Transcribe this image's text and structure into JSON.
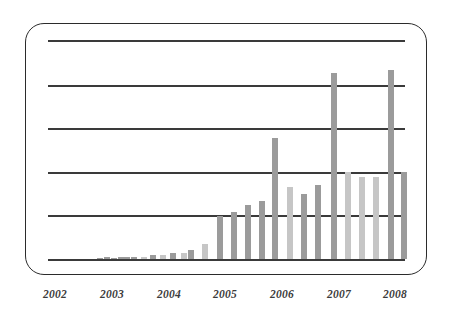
{
  "chart_data": {
    "type": "bar",
    "title": "",
    "subtitle": "",
    "xlabel": "",
    "ylabel": "",
    "grid": true,
    "legend": null,
    "annotations": [],
    "axis": {
      "x_tick_labels": [
        "2002",
        "2003",
        "2004",
        "2005",
        "2006",
        "2007",
        "2008"
      ],
      "x_tick_positions_px": [
        55,
        112,
        169,
        225,
        282,
        339,
        395
      ],
      "y_gridline_positions_px": [
        40,
        85,
        128,
        172,
        215,
        259
      ],
      "y_gridline_values": [
        5,
        4,
        3,
        2,
        1,
        0
      ],
      "ylim": [
        0,
        5
      ],
      "y_tick_labels": []
    },
    "bar_style": {
      "color_dark": "#9b9b9b",
      "color_light": "#c6c6c6",
      "width_px": 6,
      "baseline_px": 259
    },
    "series": [
      {
        "name": "quarterly value",
        "categories": [
          "2002 Q1",
          "2002 Q2",
          "2002 Q3",
          "2002 Q4",
          "2003 Q1",
          "2003 Q2",
          "2003 Q3",
          "2003 Q4",
          "2004 Q1",
          "2004 Q2",
          "2004 Q3",
          "2004 Q4",
          "2005 Q1",
          "2005 Q2",
          "2005 Q3",
          "2005 Q4",
          "2006 Q1",
          "2006 Q2",
          "2006 Q3",
          "2006 Q4",
          "2007 Q1",
          "2007 Q2",
          "2007 Q3",
          "2007 Q4",
          "2008 Q1",
          "2008 Q2"
        ],
        "values": [
          0.0,
          0.0,
          0.0,
          0.0,
          0.03,
          0.03,
          0.05,
          0.05,
          0.09,
          0.09,
          0.14,
          0.14,
          0.22,
          0.35,
          1.03,
          1.12,
          1.28,
          1.38,
          2.78,
          1.58,
          1.48,
          1.62,
          4.24,
          2.08,
          1.98,
          2.0
        ],
        "bar_x_positions_px": [
          62,
          76,
          90,
          104,
          105,
          118,
          131,
          140,
          151,
          160,
          172,
          182,
          188,
          202,
          218,
          232,
          245,
          260,
          273,
          288,
          302,
          316,
          331,
          345,
          359,
          373
        ]
      }
    ]
  },
  "bars": [
    {
      "x": 104,
      "h": 2,
      "tone": "dark",
      "label": "bar-1"
    },
    {
      "x": 118,
      "h": 2,
      "tone": "dark",
      "label": "bar-2"
    },
    {
      "x": 131,
      "h": 2.5,
      "tone": "dark",
      "label": "bar-3"
    },
    {
      "x": 141,
      "h": 2.5,
      "tone": "light",
      "label": "bar-4"
    },
    {
      "x": 150,
      "h": 4,
      "tone": "dark",
      "label": "bar-5"
    },
    {
      "x": 160,
      "h": 4,
      "tone": "light",
      "label": "bar-6"
    },
    {
      "x": 170,
      "h": 6,
      "tone": "dark",
      "label": "bar-7"
    },
    {
      "x": 181,
      "h": 6,
      "tone": "light",
      "label": "bar-8"
    },
    {
      "x": 188,
      "h": 9,
      "tone": "dark",
      "label": "bar-9"
    },
    {
      "x": 202,
      "h": 15,
      "tone": "light",
      "label": "bar-10"
    },
    {
      "x": 217,
      "h": 43,
      "tone": "dark",
      "label": "bar-11"
    },
    {
      "x": 231,
      "h": 47,
      "tone": "dark",
      "label": "bar-12"
    },
    {
      "x": 245,
      "h": 54,
      "tone": "dark",
      "label": "bar-13"
    },
    {
      "x": 259,
      "h": 58,
      "tone": "dark",
      "label": "bar-14"
    },
    {
      "x": 272,
      "h": 121,
      "tone": "dark",
      "label": "bar-15"
    },
    {
      "x": 287,
      "h": 72,
      "tone": "light",
      "label": "bar-16"
    },
    {
      "x": 301,
      "h": 65,
      "tone": "dark",
      "label": "bar-17"
    },
    {
      "x": 315,
      "h": 74,
      "tone": "dark",
      "label": "bar-18"
    },
    {
      "x": 331,
      "h": 186,
      "tone": "dark",
      "label": "bar-19"
    },
    {
      "x": 345,
      "h": 87,
      "tone": "light",
      "label": "bar-20"
    },
    {
      "x": 359,
      "h": 82,
      "tone": "light",
      "label": "bar-21"
    },
    {
      "x": 373,
      "h": 82,
      "tone": "light",
      "label": "bar-22"
    },
    {
      "x": 388,
      "h": 189,
      "tone": "dark",
      "label": "bar-23"
    },
    {
      "x": 401,
      "h": 87,
      "tone": "dark",
      "label": "bar-24"
    }
  ],
  "tiny_bars": [
    {
      "x": 97,
      "h": 1.2
    },
    {
      "x": 111,
      "h": 1.2
    },
    {
      "x": 124,
      "h": 1.6
    }
  ]
}
